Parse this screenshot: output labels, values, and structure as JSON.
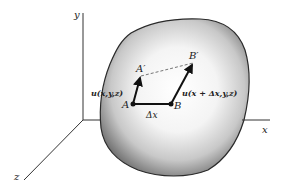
{
  "diagram": {
    "axes": {
      "x_label": "x",
      "y_label": "y",
      "z_label": "z"
    },
    "points": {
      "A": "A",
      "B": "B",
      "A_prime": "A′",
      "B_prime": "B′"
    },
    "vectors": {
      "u_at_A": "u(x,y,z)",
      "u_at_B": "u(x + Δx,y,z)"
    },
    "segment_label": "Δx",
    "colors": {
      "body_edge": "#2a2a2a",
      "body_center": "#ffffff",
      "body_shadow": "#7a7a7a",
      "axis": "#333333",
      "dashed": "#666666"
    }
  }
}
